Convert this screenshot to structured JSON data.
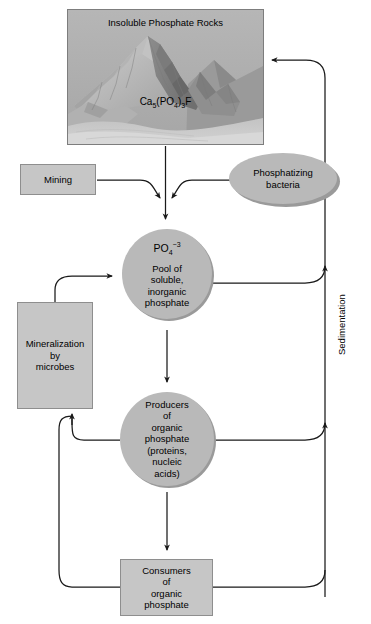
{
  "figure": {
    "type": "flow-diagram",
    "palette": {
      "box_fill": "#c6c6c6",
      "box_stroke": "#8e8e8e",
      "circle_fill": "#b9b9b9",
      "circle_shadow": "#9a9a9a",
      "panel_fill": "#b0b0b0",
      "arrow_stroke": "#1a1a1a",
      "background": "#ffffff"
    }
  },
  "nodes": {
    "rocks": {
      "title": "Insoluble Phosphate Rocks",
      "formula_prefix": "Ca",
      "formula_sub1": "5",
      "formula_mid": "(PO",
      "formula_sub2": "4",
      "formula_mid2": ")",
      "formula_sub3": "3",
      "formula_suffix": "F",
      "shape": "image-panel"
    },
    "mining": {
      "label": "Mining",
      "shape": "rectangle"
    },
    "bacteria": {
      "line1": "Phosphatizing",
      "line2": "bacteria",
      "shape": "ellipse"
    },
    "pool": {
      "ion_prefix": "PO",
      "ion_sub": "4",
      "ion_sup": "−3",
      "line1": "Pool of",
      "line2": "soluble,",
      "line3": "inorganic",
      "line4": "phosphate",
      "shape": "circle"
    },
    "mineralization": {
      "line1": "Mineralization",
      "line2": "by",
      "line3": "microbes",
      "shape": "rectangle"
    },
    "producers": {
      "line1": "Producers",
      "line2": "of",
      "line3": "organic",
      "line4": "phosphate",
      "line5": "(proteins,",
      "line6": "nucleic",
      "line7": "acids)",
      "shape": "circle"
    },
    "consumers": {
      "line1": "Consumers",
      "line2": "of",
      "line3": "organic",
      "line4": "phosphate",
      "shape": "rectangle"
    }
  },
  "edge_labels": {
    "sedimentation": "Sedimentation"
  },
  "edges": [
    {
      "from": "rocks",
      "to": "pool",
      "label": ""
    },
    {
      "from": "mining",
      "to": "pool",
      "label": ""
    },
    {
      "from": "bacteria",
      "to": "pool",
      "label": ""
    },
    {
      "from": "pool",
      "to": "producers",
      "label": ""
    },
    {
      "from": "producers",
      "to": "consumers",
      "label": ""
    },
    {
      "from": "pool",
      "to": "sedimentation-line",
      "label": "Sedimentation"
    },
    {
      "from": "producers",
      "to": "sedimentation-line",
      "label": "Sedimentation"
    },
    {
      "from": "consumers",
      "to": "sedimentation-line",
      "label": "Sedimentation"
    },
    {
      "from": "sedimentation-line",
      "to": "rocks",
      "label": "Sedimentation"
    },
    {
      "from": "producers",
      "to": "mineralization",
      "label": ""
    },
    {
      "from": "consumers",
      "to": "mineralization",
      "label": ""
    },
    {
      "from": "mineralization",
      "to": "pool",
      "label": ""
    }
  ]
}
